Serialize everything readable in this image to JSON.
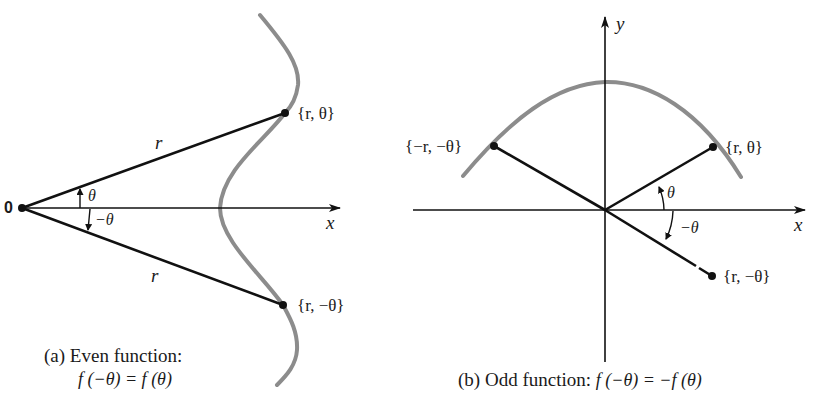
{
  "panel_a": {
    "origin_label": "0",
    "x_axis_label": "x",
    "radius_label_upper": "r",
    "radius_label_lower": "r",
    "angle_label_positive": "θ",
    "angle_label_negative": "−θ",
    "point_upper_label": "{r,  θ}",
    "point_lower_label": "{r, −θ}",
    "caption_line1": "(a)  Even function:",
    "caption_line2": "f (−θ)  =  f (θ)"
  },
  "panel_b": {
    "x_axis_label": "x",
    "y_axis_label": "y",
    "angle_label_positive": "θ",
    "angle_label_negative": "−θ",
    "point_first_quadrant_label": "{r,  θ}",
    "point_second_quadrant_label": "{−r, −θ}",
    "point_fourth_quadrant_label": "{r, −θ}",
    "caption_prefix": "(b)  Odd function:  ",
    "caption_formula": "f (−θ) = −f (θ)"
  },
  "colors": {
    "curve": "#8c8c8c",
    "ink": "#111111",
    "background": "#ffffff"
  }
}
